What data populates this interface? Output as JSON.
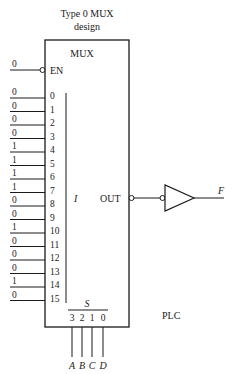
{
  "title": {
    "line1": "Type 0 MUX",
    "line2": "design"
  },
  "mux": {
    "label": "MUX",
    "enable": {
      "label": "EN",
      "value": "0"
    },
    "inputs": [
      {
        "index": "0",
        "value": "0"
      },
      {
        "index": "1",
        "value": "0"
      },
      {
        "index": "2",
        "value": "0"
      },
      {
        "index": "3",
        "value": "0"
      },
      {
        "index": "4",
        "value": "1"
      },
      {
        "index": "5",
        "value": "1"
      },
      {
        "index": "6",
        "value": "1"
      },
      {
        "index": "7",
        "value": "1"
      },
      {
        "index": "8",
        "value": "0"
      },
      {
        "index": "9",
        "value": "0"
      },
      {
        "index": "10",
        "value": "1"
      },
      {
        "index": "11",
        "value": "0"
      },
      {
        "index": "12",
        "value": "0"
      },
      {
        "index": "13",
        "value": "0"
      },
      {
        "index": "14",
        "value": "1"
      },
      {
        "index": "15",
        "value": "0"
      }
    ],
    "input_bus_label": "I",
    "output_label": "OUT",
    "select_label": "S",
    "select_bits": [
      "3",
      "2",
      "1",
      "0"
    ],
    "select_signals": [
      "A",
      "B",
      "C",
      "D"
    ]
  },
  "output_signal": "F",
  "footer_label": "PLC"
}
